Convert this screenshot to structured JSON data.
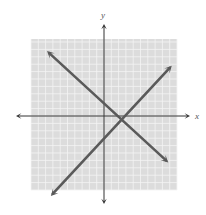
{
  "chart_data": {
    "type": "line",
    "title": "",
    "xlabel": "x",
    "ylabel": "y",
    "grid": true,
    "xlim": [
      -10,
      10
    ],
    "ylim": [
      -10,
      10
    ],
    "grid_step": 1,
    "series": [
      {
        "name": "decreasing line",
        "points": [
          [
            -7.5,
            8.5
          ],
          [
            8.5,
            -6.0
          ]
        ],
        "arrows": "both",
        "style": "line"
      },
      {
        "name": "increasing line",
        "points": [
          [
            -7.0,
            -10.5
          ],
          [
            9.0,
            6.5
          ]
        ],
        "arrows": "both",
        "style": "line"
      }
    ],
    "intersection": [
      3.0,
      1.5
    ]
  },
  "colors": {
    "grid_background": "#dcdcdc",
    "grid_lines": "#f4f4f4",
    "axes": "#333333",
    "lines": "#5a5a5a"
  }
}
